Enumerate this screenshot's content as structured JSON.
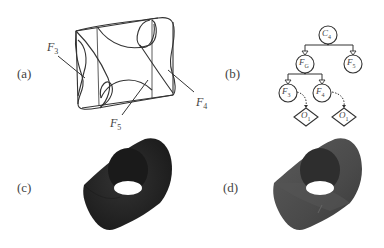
{
  "panels": {
    "a": {
      "label": "(a)",
      "annotations": [
        {
          "id": "F3",
          "text": "F",
          "sub": "3"
        },
        {
          "id": "F4",
          "text": "F",
          "sub": "4"
        },
        {
          "id": "F5",
          "text": "F",
          "sub": "5"
        }
      ]
    },
    "b": {
      "label": "(b)",
      "tree": {
        "root": {
          "text": "C",
          "sub": "4"
        },
        "level1": [
          {
            "text": "F",
            "sub": "G"
          },
          {
            "text": "F",
            "sub": "5"
          }
        ],
        "level2": [
          {
            "text": "F",
            "sub": "3"
          },
          {
            "text": "F",
            "sub": "4"
          }
        ],
        "leaves": [
          {
            "text": "O",
            "sub": "1"
          },
          {
            "text": "O",
            "sub": "1"
          }
        ]
      }
    },
    "c": {
      "label": "(c)"
    },
    "d": {
      "label": "(d)"
    }
  },
  "colors": {
    "line": "#333333",
    "solid_dark": "#262626",
    "solid_shaded": "#4a4a4a",
    "background": "#ffffff"
  }
}
